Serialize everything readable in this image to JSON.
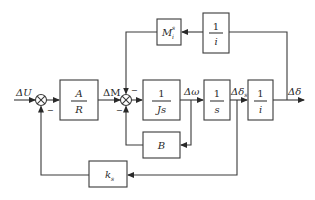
{
  "diagram": {
    "type": "control-block-diagram",
    "signals": {
      "input": "ΔU",
      "torque": "ΔM",
      "speed": "Δω",
      "angle_s": "Δδ",
      "angle_s_sub": "s",
      "output": "Δδ"
    },
    "blocks": {
      "gain_A_R": {
        "num": "A",
        "den": "R"
      },
      "inertia": {
        "num": "1",
        "den": "Js"
      },
      "integrator": {
        "num": "1",
        "den": "s"
      },
      "ratio_forward": {
        "num": "1",
        "den": "i"
      },
      "ratio_feedback": {
        "num": "1",
        "den": "i"
      },
      "load_torque": {
        "main": "M",
        "sup": "s",
        "sub": "i"
      },
      "damping": {
        "label": "B"
      },
      "back_emf": {
        "main": "k",
        "sub": "s"
      }
    },
    "summing_junctions": [
      {
        "id": "sum1",
        "signs": [
          "+",
          "−"
        ]
      },
      {
        "id": "sum2",
        "signs": [
          "+",
          "−",
          "−"
        ]
      }
    ],
    "colors": {
      "line": "#3a3a3a",
      "text": "#2a2a2a",
      "background": "#ffffff"
    }
  }
}
